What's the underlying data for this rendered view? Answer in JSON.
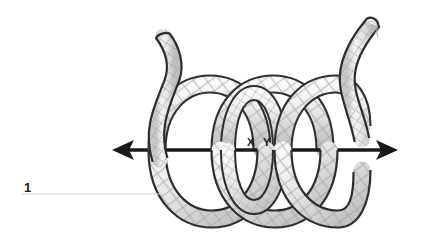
{
  "figure": {
    "caption_number": "1",
    "labels": {
      "point_x": "X",
      "point_y": "Y"
    },
    "colors": {
      "outline": "#2b2b2b",
      "axis": "#1a1a1a",
      "tube_fill_light": "#f2f2f2",
      "tube_fill_mid": "#d9d9d9",
      "tube_fill_shadow": "#b5b5b5",
      "braid": "#9a9a9a",
      "leader_line": "#d2d2d2",
      "background": "#ffffff"
    },
    "geometry": {
      "axis_y": 150,
      "axis_left_tip_x": 112,
      "axis_right_tip_x": 398,
      "coil_top_y": 82,
      "coil_bottom_y": 221,
      "coil_left_x": 150,
      "coil_right_x": 360,
      "loop_count": 3,
      "label_x_pos": [
        247,
        146
      ],
      "label_y_pos": [
        263,
        146
      ],
      "fignum_pos": [
        24,
        192
      ],
      "leader_line_x1": 22,
      "leader_line_x2": 162,
      "leader_line_y": 194
    }
  }
}
